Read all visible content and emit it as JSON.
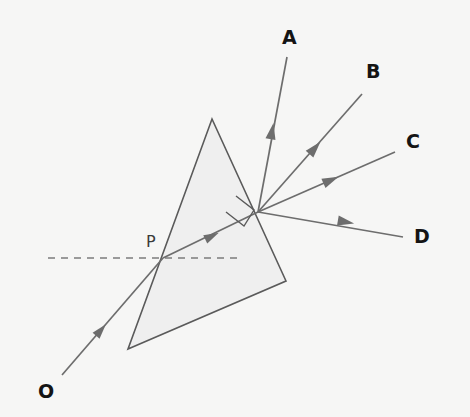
{
  "figure": {
    "kind": "optics-ray-diagram",
    "background_color": "#f6f6f5",
    "width": 470,
    "height": 417
  },
  "prism": {
    "name": "triangular-prism",
    "fill_color": "#efefef",
    "stroke_color": "#5a5a5a",
    "stroke_width": 1.6,
    "vertices": [
      {
        "label": "apex",
        "x": 212,
        "y": 119
      },
      {
        "label": "bottom-right",
        "x": 286,
        "y": 281
      },
      {
        "label": "bottom-left",
        "x": 128,
        "y": 349
      }
    ]
  },
  "normal_line": {
    "name": "normal-dashed-line",
    "style": "dashed",
    "color": "#7c7c7c",
    "dash_pattern": "7,6",
    "x1": 48,
    "y1": 258,
    "x2": 240,
    "y2": 258
  },
  "right_angle_marker": {
    "name": "right-angle-marker",
    "color": "#5a5a5a",
    "points": "236,196 254,210 244,226 226,212"
  },
  "points": [
    {
      "id": "O",
      "label": "O",
      "x": 62,
      "y": 375,
      "label_x": 38,
      "label_y": 382
    },
    {
      "id": "P",
      "label": "P",
      "x": 163,
      "y": 258,
      "label_x": 146,
      "label_y": 234
    },
    {
      "id": "V",
      "label": "",
      "x": 258,
      "y": 212,
      "label_x": 0,
      "label_y": 0
    }
  ],
  "rays": [
    {
      "id": "incident",
      "name": "incident-ray-O-to-P",
      "label": "",
      "color": "#6d6d6d",
      "width": 1.7,
      "from": {
        "x": 62,
        "y": 375
      },
      "to": {
        "x": 163,
        "y": 258
      },
      "arrow_at": {
        "x": 101,
        "y": 330
      },
      "arrow_size": 10
    },
    {
      "id": "internal",
      "name": "internal-refracted-ray-P-to-vertex",
      "label": "",
      "color": "#6d6d6d",
      "width": 1.7,
      "from": {
        "x": 163,
        "y": 258
      },
      "to": {
        "x": 258,
        "y": 212
      },
      "arrow_at": {
        "x": 212,
        "y": 236
      },
      "arrow_size": 10
    },
    {
      "id": "A",
      "name": "emergent-ray-A",
      "label": "A",
      "color": "#6d6d6d",
      "width": 1.7,
      "from": {
        "x": 258,
        "y": 212
      },
      "to": {
        "x": 287,
        "y": 57
      },
      "arrow_at": {
        "x": 272,
        "y": 131
      },
      "arrow_size": 11,
      "label_x": 282,
      "label_y": 28
    },
    {
      "id": "B",
      "name": "emergent-ray-B",
      "label": "B",
      "color": "#6d6d6d",
      "width": 1.7,
      "from": {
        "x": 258,
        "y": 212
      },
      "to": {
        "x": 362,
        "y": 94
      },
      "arrow_at": {
        "x": 315,
        "y": 148
      },
      "arrow_size": 11,
      "label_x": 366,
      "label_y": 62
    },
    {
      "id": "C",
      "name": "emergent-ray-C",
      "label": "C",
      "color": "#6d6d6d",
      "width": 1.7,
      "from": {
        "x": 258,
        "y": 212
      },
      "to": {
        "x": 395,
        "y": 152
      },
      "arrow_at": {
        "x": 331,
        "y": 180
      },
      "arrow_size": 11,
      "label_x": 406,
      "label_y": 132
    },
    {
      "id": "D",
      "name": "emergent-ray-D",
      "label": "D",
      "color": "#6d6d6d",
      "width": 1.7,
      "from": {
        "x": 258,
        "y": 212
      },
      "to": {
        "x": 403,
        "y": 237
      },
      "arrow_at": {
        "x": 346,
        "y": 222
      },
      "arrow_size": 11,
      "label_x": 414,
      "label_y": 227
    }
  ]
}
